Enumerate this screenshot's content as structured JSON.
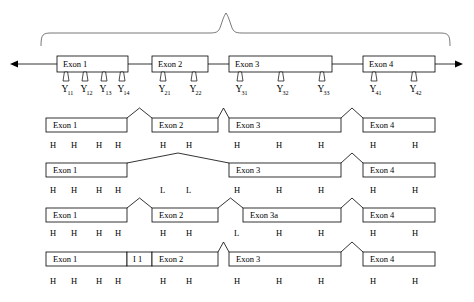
{
  "figure": {
    "stroke_color": "#000000",
    "brace_color": "#555555",
    "background": "#ffffff"
  },
  "genomic_row": {
    "name": "genomic-dna",
    "arrow_left_x": 10,
    "arrow_right_x": 463,
    "baseline_y": 64,
    "exons": [
      {
        "label": "Exon 1",
        "x": 57,
        "w": 71
      },
      {
        "label": "Exon 2",
        "x": 152,
        "w": 56
      },
      {
        "label": "Exon 3",
        "x": 229,
        "w": 103
      },
      {
        "label": "Exon 4",
        "x": 363,
        "w": 72
      }
    ],
    "markers": [
      {
        "label": "Y",
        "sub": "11",
        "x": 66
      },
      {
        "label": "Y",
        "sub": "12",
        "x": 85
      },
      {
        "label": "Y",
        "sub": "13",
        "x": 104
      },
      {
        "label": "Y",
        "sub": "14",
        "x": 122
      },
      {
        "label": "Y",
        "sub": "21",
        "x": 163
      },
      {
        "label": "Y",
        "sub": "22",
        "x": 194
      },
      {
        "label": "Y",
        "sub": "31",
        "x": 240
      },
      {
        "label": "Y",
        "sub": "32",
        "x": 281
      },
      {
        "label": "Y",
        "sub": "33",
        "x": 322
      },
      {
        "label": "Y",
        "sub": "41",
        "x": 374
      },
      {
        "label": "Y",
        "sub": "42",
        "x": 414
      }
    ]
  },
  "transcripts": [
    {
      "name": "transcript-1-canonical",
      "box_y": 118,
      "letters_y": 148,
      "exons": [
        {
          "label": "Exon 1",
          "x": 46,
          "w": 81
        },
        {
          "label": "Exon 2",
          "x": 152,
          "w": 66
        },
        {
          "label": "Exon 3",
          "x": 229,
          "w": 112
        },
        {
          "label": "Exon 4",
          "x": 363,
          "w": 72
        }
      ],
      "letters": [
        {
          "text": "H",
          "x": 50
        },
        {
          "text": "H",
          "x": 71
        },
        {
          "text": "H",
          "x": 96
        },
        {
          "text": "H",
          "x": 115
        },
        {
          "text": "H",
          "x": 160
        },
        {
          "text": "H",
          "x": 186
        },
        {
          "text": "H",
          "x": 234
        },
        {
          "text": "H",
          "x": 276
        },
        {
          "text": "H",
          "x": 318
        },
        {
          "text": "H",
          "x": 370
        },
        {
          "text": "H",
          "x": 412
        }
      ]
    },
    {
      "name": "transcript-2-exon2-skipped",
      "box_y": 163,
      "letters_y": 193,
      "exons": [
        {
          "label": "Exon 1",
          "x": 46,
          "w": 81
        },
        {
          "label": "Exon 3",
          "x": 229,
          "w": 112
        },
        {
          "label": "Exon 4",
          "x": 363,
          "w": 72
        }
      ],
      "letters": [
        {
          "text": "H",
          "x": 50
        },
        {
          "text": "H",
          "x": 71
        },
        {
          "text": "H",
          "x": 96
        },
        {
          "text": "H",
          "x": 115
        },
        {
          "text": "L",
          "x": 160
        },
        {
          "text": "L",
          "x": 186
        },
        {
          "text": "H",
          "x": 234
        },
        {
          "text": "H",
          "x": 276
        },
        {
          "text": "H",
          "x": 318
        },
        {
          "text": "H",
          "x": 370
        },
        {
          "text": "H",
          "x": 412
        }
      ]
    },
    {
      "name": "transcript-3-alt-3prime-exon3a",
      "box_y": 208,
      "letters_y": 236,
      "exons": [
        {
          "label": "Exon 1",
          "x": 46,
          "w": 81
        },
        {
          "label": "Exon 2",
          "x": 152,
          "w": 66
        },
        {
          "label": "Exon 3a",
          "x": 243,
          "w": 98
        },
        {
          "label": "Exon 4",
          "x": 363,
          "w": 72
        }
      ],
      "letters": [
        {
          "text": "H",
          "x": 50
        },
        {
          "text": "H",
          "x": 71
        },
        {
          "text": "H",
          "x": 96
        },
        {
          "text": "H",
          "x": 115
        },
        {
          "text": "H",
          "x": 160
        },
        {
          "text": "H",
          "x": 186
        },
        {
          "text": "L",
          "x": 234
        },
        {
          "text": "H",
          "x": 276
        },
        {
          "text": "H",
          "x": 318
        },
        {
          "text": "H",
          "x": 370
        },
        {
          "text": "H",
          "x": 412
        }
      ]
    },
    {
      "name": "transcript-4-intron1-retained",
      "box_y": 252,
      "letters_y": 284,
      "exons": [
        {
          "label": "Exon 1",
          "x": 46,
          "w": 81
        },
        {
          "label": "I 1",
          "x": 127,
          "w": 25
        },
        {
          "label": "Exon 2",
          "x": 152,
          "w": 66
        },
        {
          "label": "Exon 3",
          "x": 229,
          "w": 112
        },
        {
          "label": "Exon 4",
          "x": 363,
          "w": 72
        }
      ],
      "letters": [
        {
          "text": "H",
          "x": 50
        },
        {
          "text": "H",
          "x": 71
        },
        {
          "text": "H",
          "x": 96
        },
        {
          "text": "H",
          "x": 115
        },
        {
          "text": "H",
          "x": 160
        },
        {
          "text": "H",
          "x": 186
        },
        {
          "text": "H",
          "x": 234
        },
        {
          "text": "H",
          "x": 276
        },
        {
          "text": "H",
          "x": 318
        },
        {
          "text": "H",
          "x": 370
        },
        {
          "text": "H",
          "x": 412
        }
      ]
    }
  ]
}
